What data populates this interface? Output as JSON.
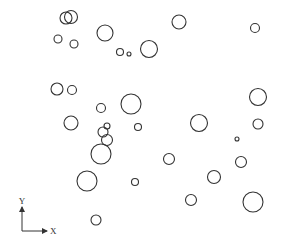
{
  "diagram": {
    "width": 284,
    "height": 244,
    "stroke_color": "#333333",
    "background": "#ffffff",
    "circles": [
      {
        "cx": 66,
        "cy": 18,
        "r": 6
      },
      {
        "cx": 71,
        "cy": 17,
        "r": 6.5
      },
      {
        "cx": 58,
        "cy": 39,
        "r": 4
      },
      {
        "cx": 74,
        "cy": 44,
        "r": 4
      },
      {
        "cx": 105,
        "cy": 33,
        "r": 8
      },
      {
        "cx": 120,
        "cy": 52,
        "r": 3.5
      },
      {
        "cx": 129,
        "cy": 54,
        "r": 2
      },
      {
        "cx": 149,
        "cy": 49,
        "r": 8.5
      },
      {
        "cx": 179,
        "cy": 22,
        "r": 7
      },
      {
        "cx": 255,
        "cy": 28,
        "r": 4.5
      },
      {
        "cx": 57,
        "cy": 89,
        "r": 6
      },
      {
        "cx": 72,
        "cy": 90,
        "r": 4.5
      },
      {
        "cx": 101,
        "cy": 108,
        "r": 4.5
      },
      {
        "cx": 131,
        "cy": 104,
        "r": 10
      },
      {
        "cx": 258,
        "cy": 97,
        "r": 8.5
      },
      {
        "cx": 71,
        "cy": 123,
        "r": 7
      },
      {
        "cx": 107,
        "cy": 126,
        "r": 3
      },
      {
        "cx": 103,
        "cy": 132,
        "r": 5
      },
      {
        "cx": 107,
        "cy": 140,
        "r": 5.5
      },
      {
        "cx": 101,
        "cy": 154,
        "r": 10
      },
      {
        "cx": 138,
        "cy": 127,
        "r": 3.5
      },
      {
        "cx": 199,
        "cy": 123,
        "r": 8.5
      },
      {
        "cx": 237,
        "cy": 139,
        "r": 2
      },
      {
        "cx": 258,
        "cy": 124,
        "r": 5
      },
      {
        "cx": 169,
        "cy": 159,
        "r": 5.5
      },
      {
        "cx": 241,
        "cy": 162,
        "r": 5.5
      },
      {
        "cx": 214,
        "cy": 177,
        "r": 6.5
      },
      {
        "cx": 87,
        "cy": 181,
        "r": 10
      },
      {
        "cx": 135,
        "cy": 182,
        "r": 3.5
      },
      {
        "cx": 191,
        "cy": 200,
        "r": 5.5
      },
      {
        "cx": 253,
        "cy": 202,
        "r": 10
      },
      {
        "cx": 96,
        "cy": 220,
        "r": 5
      }
    ],
    "axes": {
      "origin": {
        "x": 22,
        "y": 231
      },
      "y_end": {
        "x": 22,
        "y": 207
      },
      "x_end": {
        "x": 47,
        "y": 231
      },
      "y_label": "Y",
      "x_label": "X"
    }
  }
}
